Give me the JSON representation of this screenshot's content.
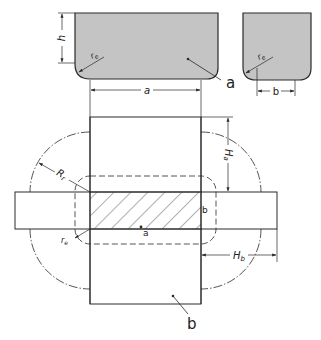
{
  "diagram": {
    "type": "technical-drawing",
    "colors": {
      "line": "#2a2a2a",
      "fill_section": "#c4c4c4",
      "background": "#ffffff"
    },
    "top_views": {
      "profile_a": {
        "leader_label": "a",
        "dim_height": "h",
        "dim_radius": "r_e",
        "radius_label": "re",
        "dim_width": "a"
      },
      "profile_b": {
        "dim_radius": "r_e",
        "radius_label": "re",
        "dim_width": "b"
      }
    },
    "main_view": {
      "label_Ha": "Ha",
      "label_Ha_main": "H",
      "label_Ha_sub": "a",
      "label_Hb_main": "H",
      "label_Hb_sub": "b",
      "label_Rr_main": "R",
      "label_Rr_sub": "r",
      "label_re_main": "r",
      "label_re_sub": "e",
      "label_center_a": "a",
      "label_side_b": "b",
      "leader_label_b": "b"
    }
  }
}
